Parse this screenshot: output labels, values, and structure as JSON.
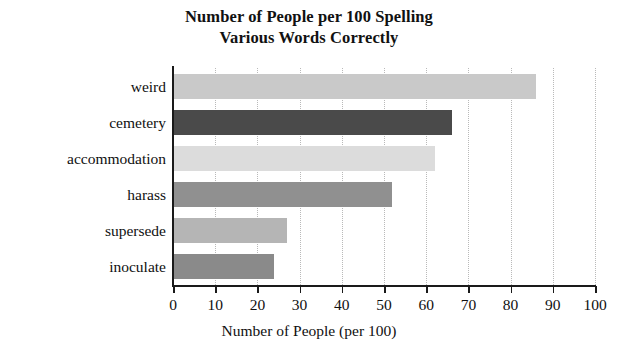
{
  "chart_data": {
    "type": "bar",
    "orientation": "horizontal",
    "title": "Number of People per 100 Spelling Various Words Correctly",
    "title_lines": [
      "Number of People per 100 Spelling",
      "Various Words Correctly"
    ],
    "categories": [
      "weird",
      "cemetery",
      "accommodation",
      "harass",
      "supersede",
      "inoculate"
    ],
    "values": [
      86,
      66,
      62,
      52,
      27,
      24
    ],
    "bar_colors": [
      "#c9c9c9",
      "#4a4a4a",
      "#dcdcdc",
      "#909090",
      "#b5b5b5",
      "#8a8a8a"
    ],
    "xlabel": "Number of People (per 100)",
    "ylabel": "",
    "xlim": [
      0,
      100
    ],
    "xticks": [
      0,
      10,
      20,
      30,
      40,
      50,
      60,
      70,
      80,
      90,
      100
    ],
    "xtick_labels": [
      "0",
      "10",
      "20",
      "30",
      "40",
      "50",
      "60",
      "70",
      "80",
      "90",
      "100"
    ],
    "grid": "vertical-dotted",
    "legend": "none"
  }
}
